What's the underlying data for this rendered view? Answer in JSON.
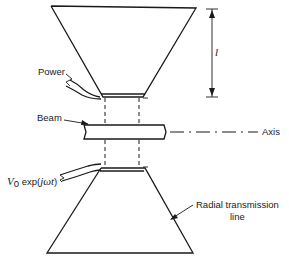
{
  "diagram": {
    "labels": {
      "power": "Power",
      "beam": "Beam",
      "axis": "Axis",
      "source": "V₀ exp(jωt)",
      "source_v": "V",
      "source_sub": "0",
      "source_rest": " exp(",
      "source_j": "jωt",
      "source_close": ")",
      "radial_line_1": "Radial transmission",
      "radial_line_2": "line",
      "length": "l"
    },
    "components": [
      "upper-cone",
      "lower-cone",
      "gap",
      "beam-tube",
      "power-coax",
      "source-coax",
      "length-dimension",
      "axis-line"
    ]
  }
}
